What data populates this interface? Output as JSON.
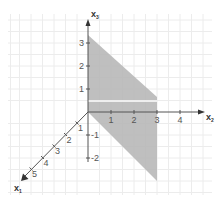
{
  "diagram": {
    "type": "3d-coordinate-system-cabinet-projection",
    "colors": {
      "background": "#ffffff",
      "grid": "#ececec",
      "axis": "#555555",
      "region_fill": "#b8b8b8",
      "highlight_line": "#ffffff",
      "tick_text": "#555555"
    },
    "axes": {
      "x1": {
        "label": "x",
        "subscript": "1",
        "ticks": [
          "1",
          "2",
          "3",
          "4",
          "5"
        ]
      },
      "x2": {
        "label": "x",
        "subscript": "2",
        "ticks": [
          "1",
          "2",
          "3",
          "4"
        ]
      },
      "x3": {
        "label": "x",
        "subscript": "3",
        "ticks_positive": [
          "1",
          "2",
          "3"
        ],
        "ticks_negative": [
          "-1",
          "-2"
        ]
      }
    },
    "region": {
      "description": "shaded parallelogram in the x2-x3 plane direction, bounded by x2=0 and x2=3",
      "vertices_approx": [
        [
          0,
          0,
          3.6
        ],
        [
          0,
          3,
          0.6
        ],
        [
          0,
          3,
          -3
        ],
        [
          0,
          0,
          0
        ]
      ]
    },
    "highlight_line": {
      "description": "white line across shaded region",
      "x3_approx": 0.5,
      "x2_range": [
        0,
        3
      ]
    }
  }
}
